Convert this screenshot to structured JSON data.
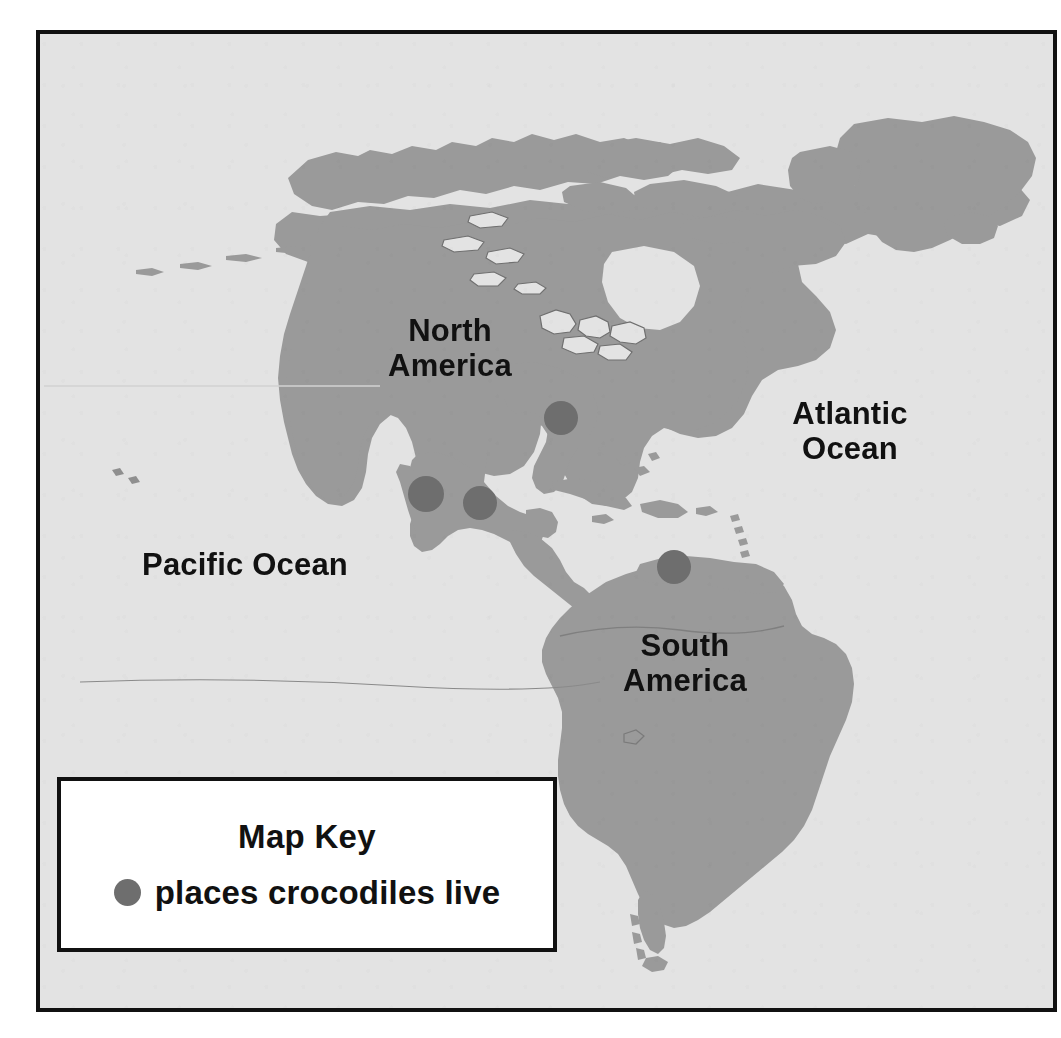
{
  "map": {
    "name": "crocodile-habitat-map",
    "background_color": "#e3e3e3",
    "land_color": "#9a9a9a",
    "border_color": "#111111",
    "marker_color": "#6e6e6e",
    "labels": [
      {
        "id": "north-america",
        "text": "North\nAmerica"
      },
      {
        "id": "atlantic-ocean",
        "text": "Atlantic\nOcean"
      },
      {
        "id": "pacific-ocean",
        "text": "Pacific Ocean"
      },
      {
        "id": "south-america",
        "text": "South\nAmerica"
      }
    ],
    "markers": [
      {
        "id": "marker-florida",
        "cx": 557,
        "cy": 414,
        "r": 17
      },
      {
        "id": "marker-west-mexico",
        "cx": 422,
        "cy": 490,
        "r": 18
      },
      {
        "id": "marker-yucatan",
        "cx": 476,
        "cy": 499,
        "r": 17
      },
      {
        "id": "marker-northern-south-america",
        "cx": 670,
        "cy": 563,
        "r": 17
      }
    ]
  },
  "map_key": {
    "title": "Map Key",
    "entry_label": "places crocodiles live",
    "swatch_color": "#6e6e6e"
  }
}
